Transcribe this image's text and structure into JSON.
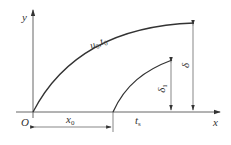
{
  "diagram": {
    "axes": {
      "x_label": "x",
      "y_label": "y",
      "origin_label": "O"
    },
    "curves": [
      {
        "name": "outer-boundary",
        "label": "u",
        "label_sub": "0",
        "label2": ",t",
        "label2_sub": "0"
      },
      {
        "name": "inner-boundary"
      }
    ],
    "dimensions": {
      "x0": {
        "main": "x",
        "sub": "0"
      },
      "ts": {
        "main": "t",
        "sub": "s"
      },
      "delta": {
        "main": "δ"
      },
      "delta1": {
        "main": "δ",
        "sub": "1"
      }
    },
    "colors": {
      "line": "#333333",
      "thin": "#555555"
    }
  }
}
